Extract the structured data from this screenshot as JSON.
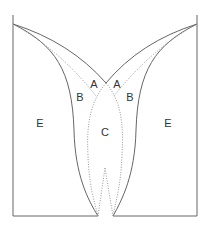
{
  "diagram": {
    "colors": {
      "solid_line": "#666666",
      "dotted_line": "#999999",
      "label": "#333333",
      "background": "#ffffff"
    },
    "regions": [
      {
        "id": "A-left",
        "label": "A",
        "x": 94,
        "y": 84
      },
      {
        "id": "A-right",
        "label": "A",
        "x": 117,
        "y": 84
      },
      {
        "id": "B-left",
        "label": "B",
        "x": 80,
        "y": 97
      },
      {
        "id": "B-right",
        "label": "B",
        "x": 130,
        "y": 97
      },
      {
        "id": "C",
        "label": "C",
        "x": 105,
        "y": 132
      },
      {
        "id": "E-left",
        "label": "E",
        "x": 40,
        "y": 123
      },
      {
        "id": "E-right",
        "label": "E",
        "x": 168,
        "y": 123
      }
    ]
  }
}
